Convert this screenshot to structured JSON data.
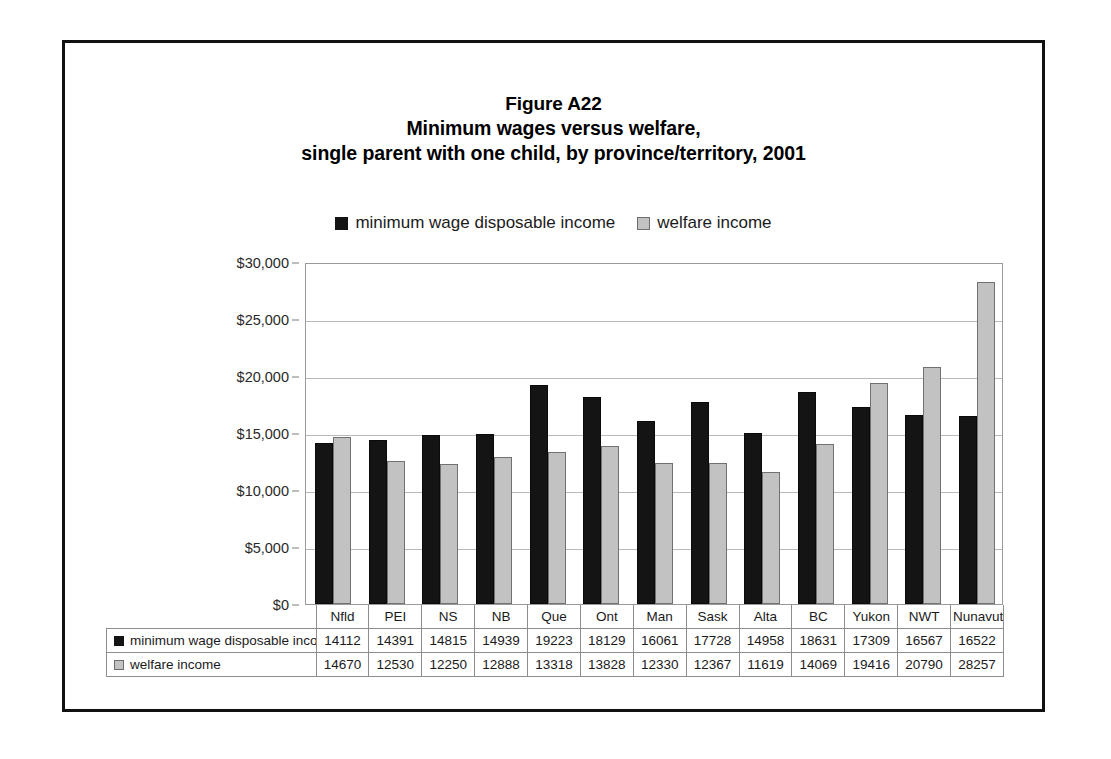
{
  "figure": {
    "title_lines": [
      "Figure A22",
      "Minimum wages versus welfare,",
      "single parent with one child, by province/territory, 2001"
    ]
  },
  "legend": {
    "position": "top-center",
    "entries": [
      {
        "label": "minimum wage disposable income",
        "swatch": "series0",
        "color": "#141414"
      },
      {
        "label": "welfare income",
        "swatch": "series1",
        "color": "#c2c2c2"
      }
    ]
  },
  "chart_data": {
    "type": "bar",
    "xlabel": "",
    "ylabel": "",
    "ylim": [
      0,
      30000
    ],
    "ytick_values": [
      0,
      5000,
      10000,
      15000,
      20000,
      25000,
      30000
    ],
    "ytick_labels": [
      "$0",
      "$5,000",
      "$10,000",
      "$15,000",
      "$20,000",
      "$25,000",
      "$30,000"
    ],
    "grid": true,
    "legend_position": "top-center",
    "categories": [
      "Nfld",
      "PEI",
      "NS",
      "NB",
      "Que",
      "Ont",
      "Man",
      "Sask",
      "Alta",
      "BC",
      "Yukon",
      "NWT",
      "Nunavut"
    ],
    "series": [
      {
        "name": "minimum wage disposable income",
        "color": "#141414",
        "values": [
          14112,
          14391,
          14815,
          14939,
          19223,
          18129,
          16061,
          17728,
          14958,
          18631,
          17309,
          16567,
          16522
        ]
      },
      {
        "name": "welfare income",
        "color": "#c2c2c2",
        "values": [
          14670,
          12530,
          12250,
          12888,
          13318,
          13828,
          12330,
          12367,
          11619,
          14069,
          19416,
          20790,
          28257
        ]
      }
    ]
  },
  "data_table": {
    "corner_label": "",
    "column_headers": [
      "Nfld",
      "PEI",
      "NS",
      "NB",
      "Que",
      "Ont",
      "Man",
      "Sask",
      "Alta",
      "BC",
      "Yukon",
      "NWT",
      "Nunavut"
    ],
    "rows": [
      {
        "label": "minimum wage disposable income",
        "swatch": "series0",
        "values": [
          "14112",
          "14391",
          "14815",
          "14939",
          "19223",
          "18129",
          "16061",
          "17728",
          "14958",
          "18631",
          "17309",
          "16567",
          "16522"
        ]
      },
      {
        "label": "welfare income",
        "swatch": "series1",
        "values": [
          "14670",
          "12530",
          "12250",
          "12888",
          "13318",
          "13828",
          "12330",
          "12367",
          "11619",
          "14069",
          "19416",
          "20790",
          "28257"
        ]
      }
    ]
  }
}
